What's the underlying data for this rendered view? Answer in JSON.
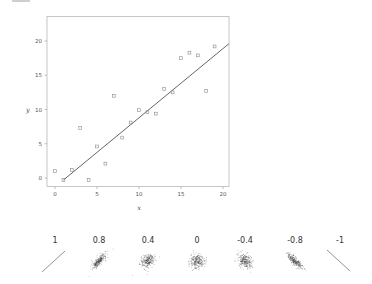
{
  "chart_data": [
    {
      "type": "scatter",
      "title": "",
      "xlabel": "x",
      "ylabel": "y",
      "xlim": [
        -1,
        20.7
      ],
      "ylim": [
        -1.3,
        22.5
      ],
      "grid": false,
      "legend": null,
      "xticks": [
        0,
        5,
        10,
        15,
        20
      ],
      "yticks": [
        0,
        5,
        10,
        15,
        20
      ],
      "series": [
        {
          "name": "observations",
          "marker": "open-square",
          "points": [
            {
              "x": 0,
              "y": 1.0
            },
            {
              "x": 1,
              "y": -0.3
            },
            {
              "x": 2,
              "y": 1.2
            },
            {
              "x": 3,
              "y": 7.3
            },
            {
              "x": 4,
              "y": -0.3
            },
            {
              "x": 5,
              "y": 4.6
            },
            {
              "x": 6,
              "y": 2.1
            },
            {
              "x": 7,
              "y": 12.0
            },
            {
              "x": 8,
              "y": 5.9
            },
            {
              "x": 9,
              "y": 8.1
            },
            {
              "x": 10,
              "y": 9.9
            },
            {
              "x": 11,
              "y": 9.6
            },
            {
              "x": 12,
              "y": 9.4
            },
            {
              "x": 13,
              "y": 13.0
            },
            {
              "x": 14,
              "y": 12.5
            },
            {
              "x": 15,
              "y": 17.5
            },
            {
              "x": 16,
              "y": 18.3
            },
            {
              "x": 17,
              "y": 17.9
            },
            {
              "x": 18,
              "y": 12.7
            },
            {
              "x": 19,
              "y": 19.2
            }
          ]
        },
        {
          "name": "regression line",
          "type": "line",
          "points": [
            {
              "x": 1,
              "y": -0.3
            },
            {
              "x": 20.7,
              "y": 19.6
            }
          ]
        }
      ]
    },
    {
      "type": "scatter",
      "title": "Correlation examples",
      "panels": [
        {
          "label": "1",
          "r": 1
        },
        {
          "label": "0.8",
          "r": 0.8
        },
        {
          "label": "0.4",
          "r": 0.4
        },
        {
          "label": "0",
          "r": 0
        },
        {
          "label": "-0.4",
          "r": -0.4
        },
        {
          "label": "-0.8",
          "r": -0.8
        },
        {
          "label": "-1",
          "r": -1
        }
      ]
    }
  ],
  "main_plot": {
    "x_axis_label": "x",
    "y_axis_label": "y",
    "x_tick_labels": [
      "0",
      "5",
      "10",
      "15",
      "20"
    ],
    "y_tick_labels": [
      "0",
      "5",
      "10",
      "15",
      "20"
    ]
  },
  "correlation_row": {
    "labels": [
      "1",
      "0.8",
      "0.4",
      "0",
      "-0.4",
      "-0.8",
      "-1"
    ]
  },
  "colors": {
    "frame": "#b0b0b0",
    "marker": "#8a8a8a",
    "line": "#555555",
    "text": "#444444",
    "cloud": "#3a3a3a"
  }
}
